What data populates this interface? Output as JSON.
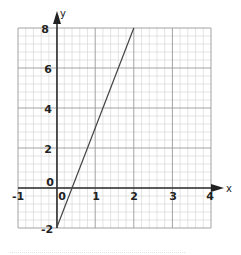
{
  "chart_data": {
    "type": "line",
    "title": "",
    "xlabel": "x",
    "ylabel": "y",
    "xlim": [
      -1,
      4
    ],
    "ylim": [
      -2,
      8
    ],
    "grid": true,
    "x_ticks": [
      "-1",
      "0",
      "1",
      "2",
      "3",
      "4"
    ],
    "y_ticks": [
      "-2",
      "0",
      "2",
      "4",
      "6",
      "8"
    ],
    "series": [
      {
        "name": "y = 5x - 2",
        "x": [
          0,
          2
        ],
        "y": [
          -2,
          8
        ]
      }
    ]
  },
  "labels": {
    "x_axis": "x",
    "y_axis": "y",
    "x_tick_m1": "-1",
    "x_tick_0": "0",
    "x_tick_1": "1",
    "x_tick_2": "2",
    "x_tick_3": "3",
    "x_tick_4": "4",
    "y_tick_m2": "-2",
    "y_tick_0": "0",
    "y_tick_2": "2",
    "y_tick_4": "4",
    "y_tick_6": "6",
    "y_tick_8": "8"
  },
  "colors": {
    "axis": "#333333",
    "major_grid": "#9a9a9a",
    "minor_grid": "#d0d0d0",
    "line": "#444444"
  }
}
